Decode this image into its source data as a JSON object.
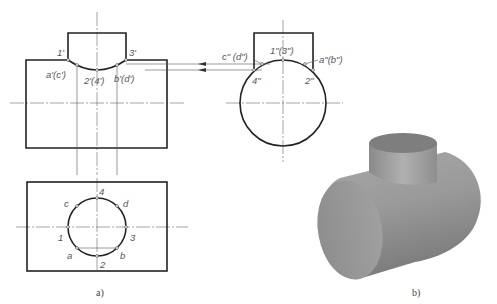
{
  "figure": {
    "panel_a": {
      "caption": "a)",
      "front_view_labels": {
        "p1": "1'",
        "p3": "3'",
        "ac": "a'(c')",
        "p24": "2'(4')",
        "bd": "b'(d')"
      },
      "side_view_labels": {
        "p13": "1\"(3\")",
        "cd": "c\" (d\")",
        "ab": "a\"(b\")",
        "p4": "4\"",
        "p2": "2\""
      },
      "top_view_labels": {
        "p4": "4",
        "c": "c",
        "d": "d",
        "p1": "1",
        "p3": "3",
        "a": "a",
        "b": "b",
        "p2": "2"
      }
    },
    "panel_b": {
      "caption": "b)",
      "description": "3D shaded T-intersection of two cylinders"
    }
  }
}
